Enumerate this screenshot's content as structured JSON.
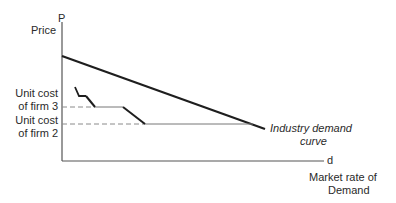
{
  "axes": {
    "y_axis_symbol": "P",
    "y_axis_label": "Price",
    "x_axis_symbol": "d",
    "x_axis_label_line1": "Market rate of",
    "x_axis_label_line2": "Demand"
  },
  "labels": {
    "firm3_line1": "Unit cost",
    "firm3_line2": "of firm 3",
    "firm2_line1": "Unit cost",
    "firm2_line2": "of firm 2",
    "demand_line1": "Industry demand",
    "demand_line2": "curve"
  },
  "colors": {
    "line": "#1e1e1e",
    "dashed": "#8a8a8a",
    "text": "#2a2a2a"
  }
}
